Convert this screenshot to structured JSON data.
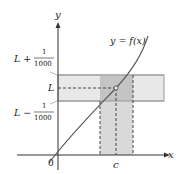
{
  "diagram": {
    "type": "epsilon-delta limit illustration",
    "curve_label": "y = f(x)",
    "axes": {
      "x_label": "x",
      "y_label": "y",
      "origin_label": "0"
    },
    "y_labels": {
      "upper": {
        "main": "L +",
        "num": "1",
        "den": "1000"
      },
      "middle": "L",
      "lower": {
        "main": "L −",
        "num": "1",
        "den": "1000"
      }
    },
    "x_labels": {
      "c": "c"
    },
    "colors": {
      "curve": "#555555",
      "axis": "#333333",
      "horizontal_band": "#e6e6e6",
      "vertical_band": "#d6d6d6",
      "overlap": "#bdbdbd",
      "band_edge": "#999999",
      "dashed": "#333333"
    }
  }
}
